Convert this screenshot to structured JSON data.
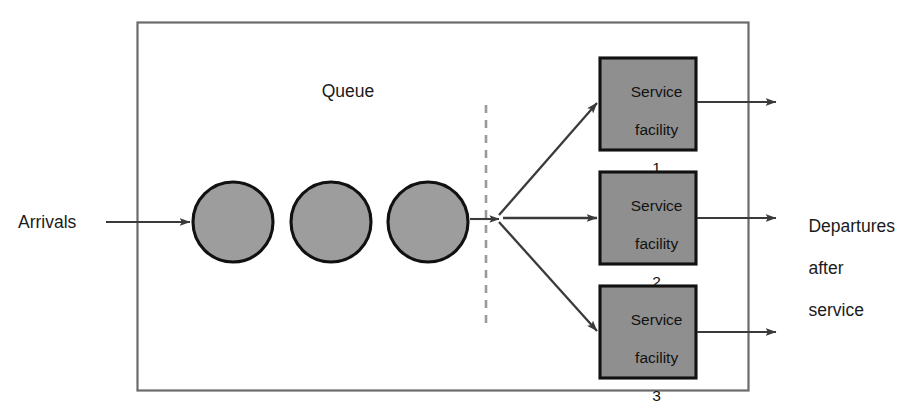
{
  "diagram": {
    "queue_label": "Queue",
    "arrivals_label": "Arrivals",
    "departures_label": "Departures\nafter\nservice",
    "departures_lines": [
      "Departures",
      "after",
      "service"
    ],
    "system_boundary": {
      "shape": "rectangle",
      "x": 137,
      "y": 22,
      "width": 611,
      "height": 368,
      "fill": "#ffffff",
      "stroke": "#6b6b6b"
    },
    "queue_units": [
      {
        "id": "customer-1",
        "cx": 233,
        "cy": 222,
        "r": 40
      },
      {
        "id": "customer-2",
        "cx": 331,
        "cy": 222,
        "r": 40
      },
      {
        "id": "customer-3",
        "cx": 428,
        "cy": 222,
        "r": 40
      }
    ],
    "queue_unit_fill": "#9d9d9d",
    "queue_unit_stroke": "#111111",
    "divider": {
      "name": "queue-service-divider",
      "x": 486,
      "y_top": 105,
      "y_bottom": 325,
      "style": "dashed",
      "color": "#9a9a9a"
    },
    "branch_point": {
      "x": 497,
      "y": 218
    },
    "facilities": [
      {
        "id": 1,
        "lines": [
          "Service",
          "facility",
          "1"
        ],
        "label": "Service facility 1",
        "number": "1",
        "x": 600,
        "y": 58,
        "width": 96,
        "height": 92,
        "fill": "#8f8f8f",
        "stroke": "#111111",
        "out_arrow_y": 102
      },
      {
        "id": 2,
        "lines": [
          "Service",
          "facility",
          "2"
        ],
        "label": "Service facility 2",
        "number": "2",
        "x": 600,
        "y": 172,
        "width": 96,
        "height": 92,
        "fill": "#8f8f8f",
        "stroke": "#111111",
        "out_arrow_y": 218
      },
      {
        "id": 3,
        "lines": [
          "Service",
          "facility",
          "3"
        ],
        "label": "Service facility 3",
        "number": "3",
        "x": 600,
        "y": 286,
        "width": 96,
        "height": 92,
        "fill": "#8f8f8f",
        "stroke": "#111111",
        "out_arrow_y": 332
      }
    ],
    "colors": {
      "background": "#ffffff",
      "ink": "#1b1b1b",
      "shape_gray": "#9a9a9a",
      "border_dark": "#111111",
      "boundary_gray": "#6b6b6b",
      "dashed_gray": "#9a9a9a",
      "arrow": "#3a3a3a"
    },
    "arrows": {
      "arrivals": {
        "from_x": 106,
        "to_x": 190,
        "y": 222
      },
      "queue_to_branch": {
        "from_x": 470,
        "to_x": 497,
        "y": 219
      },
      "branch_to_facility_1": {
        "from": [
          500,
          214
        ],
        "to": [
          596,
          104
        ]
      },
      "branch_to_facility_2": {
        "from": [
          503,
          218
        ],
        "to": [
          596,
          218
        ]
      },
      "branch_to_facility_3": {
        "from": [
          500,
          223
        ],
        "to": [
          596,
          330
        ]
      },
      "facility_1_out": {
        "from_x": 698,
        "to_x": 774,
        "y": 102
      },
      "facility_2_out": {
        "from_x": 698,
        "to_x": 774,
        "y": 218
      },
      "facility_3_out": {
        "from_x": 698,
        "to_x": 774,
        "y": 332
      }
    }
  }
}
